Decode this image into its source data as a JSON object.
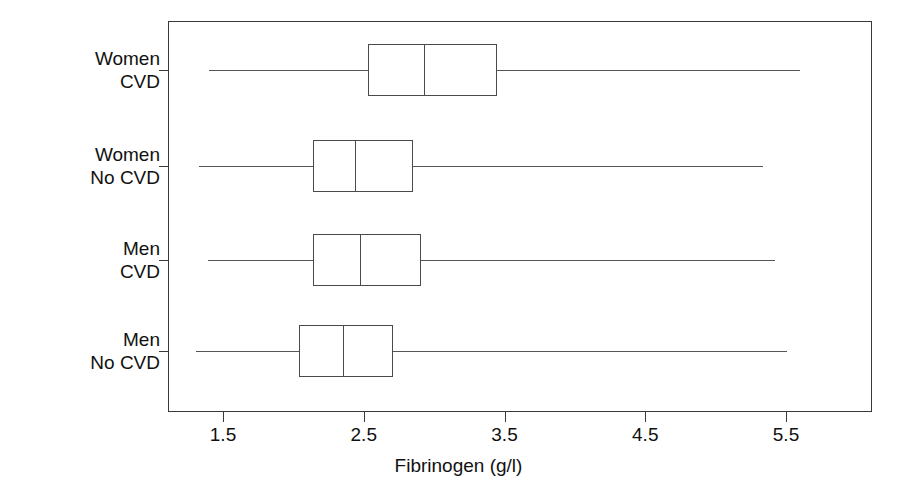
{
  "chart_data": {
    "type": "box",
    "title": "",
    "xlabel": "Fibrinogen (g/l)",
    "ylabel": "",
    "xlim": [
      1.06,
      6.11
    ],
    "xticks": [
      1.5,
      2.5,
      3.5,
      4.5,
      5.5
    ],
    "xticklabels": [
      "1.5",
      "2.5",
      "3.5",
      "4.5",
      "5.5"
    ],
    "grid": false,
    "legend": "none",
    "orientation": "horizontal",
    "categories": [
      "Women CVD",
      "Women No CVD",
      "Men CVD",
      "Men No CVD"
    ],
    "category_labels": [
      {
        "line1": "Women",
        "line2": "CVD"
      },
      {
        "line1": "Women",
        "line2": "No CVD"
      },
      {
        "line1": "Men",
        "line2": "CVD"
      },
      {
        "line1": "Men",
        "line2": "No CVD"
      }
    ],
    "boxes": [
      {
        "category": "Women CVD",
        "whisker_low": 1.4,
        "q1": 2.53,
        "median": 2.93,
        "q3": 3.45,
        "whisker_high": 5.6
      },
      {
        "category": "Women No CVD",
        "whisker_low": 1.33,
        "q1": 2.14,
        "median": 2.44,
        "q3": 2.85,
        "whisker_high": 5.34
      },
      {
        "category": "Men CVD",
        "whisker_low": 1.39,
        "q1": 2.14,
        "median": 2.47,
        "q3": 2.91,
        "whisker_high": 5.42
      },
      {
        "category": "Men No CVD",
        "whisker_low": 1.31,
        "q1": 2.04,
        "median": 2.35,
        "q3": 2.71,
        "whisker_high": 5.51
      }
    ],
    "colors": {
      "frame": "#3a3a3a",
      "box_edge": "#4a4a4a",
      "whisker": "#555555",
      "background": "#ffffff",
      "text": "#111111"
    }
  }
}
